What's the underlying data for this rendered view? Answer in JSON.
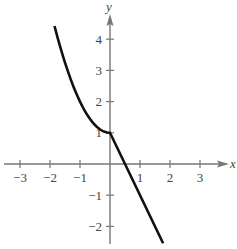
{
  "chart_data": {
    "type": "line",
    "title": "",
    "xlabel": "x",
    "ylabel": "y",
    "xlim": [
      -3.5,
      3.9
    ],
    "ylim": [
      -2.6,
      5.2
    ],
    "x_ticks": [
      -3,
      -2,
      -1,
      1,
      2,
      3
    ],
    "y_ticks": [
      -2,
      -1,
      1,
      2,
      3,
      4
    ],
    "x_tick_labels": [
      "−3",
      "−2",
      "−1",
      "1",
      "2",
      "3"
    ],
    "y_tick_labels": [
      "−2",
      "−1",
      "1",
      "2",
      "3",
      "4"
    ],
    "grid": false,
    "legend": null,
    "series": [
      {
        "name": "f(x)",
        "description": "piecewise: x^2 + 1 for x < 0; 1 - 2x for x >= 0",
        "points": [
          [
            -1.85,
            4.42
          ],
          [
            -1.5,
            3.25
          ],
          [
            -1.0,
            2.0
          ],
          [
            -0.5,
            1.25
          ],
          [
            0.0,
            1.0
          ],
          [
            0.5,
            0.0
          ],
          [
            1.0,
            -1.0
          ],
          [
            1.5,
            -2.0
          ],
          [
            1.77,
            -2.54
          ]
        ],
        "color": "#111111"
      }
    ]
  },
  "axes": {
    "x_name": "x",
    "y_name": "y"
  }
}
